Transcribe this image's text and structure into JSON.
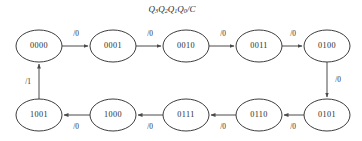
{
  "diagram": {
    "title": {
      "full": "Q3Q2Q1Q0/C",
      "parts": [
        {
          "base": "Q",
          "sub": "3"
        },
        {
          "base": "Q",
          "sub": "2"
        },
        {
          "base": "Q",
          "sub": "1"
        },
        {
          "base": "Q",
          "sub": "0"
        }
      ],
      "suffix": "/C"
    },
    "type": "state-transition-diagram",
    "colors": {
      "background": "#ffffff",
      "stroke": "#3d3d3d",
      "edge": "#4a4a4a",
      "text": "#2b2b2b"
    },
    "geometry": {
      "node_rx": 23,
      "node_ry": 16,
      "row_top_y": 46,
      "row_bottom_y": 115,
      "columns_x": [
        39,
        113,
        186,
        259,
        327
      ]
    },
    "nodes": [
      {
        "id": "s0",
        "label": "0000",
        "cx": 39,
        "cy": 46,
        "row": "top"
      },
      {
        "id": "s1",
        "label": "0001",
        "cx": 113,
        "cy": 46,
        "row": "top"
      },
      {
        "id": "s2",
        "label": "0010",
        "cx": 186,
        "cy": 46,
        "row": "top"
      },
      {
        "id": "s3",
        "label": "0011",
        "cx": 259,
        "cy": 46,
        "row": "top"
      },
      {
        "id": "s4",
        "label": "0100",
        "cx": 327,
        "cy": 46,
        "row": "top"
      },
      {
        "id": "s5",
        "label": "0101",
        "cx": 327,
        "cy": 115,
        "row": "bottom"
      },
      {
        "id": "s6",
        "label": "0110",
        "cx": 259,
        "cy": 115,
        "row": "bottom"
      },
      {
        "id": "s7",
        "label": "0111",
        "cx": 186,
        "cy": 115,
        "row": "bottom"
      },
      {
        "id": "s8",
        "label": "1000",
        "cx": 113,
        "cy": 115,
        "row": "bottom"
      },
      {
        "id": "s9",
        "label": "1001",
        "cx": 39,
        "cy": 115,
        "row": "bottom"
      }
    ],
    "edges": [
      {
        "id": "e0",
        "from": "0000",
        "to": "0001",
        "label": "/0",
        "lx": 76,
        "ly": 34,
        "direction": "right"
      },
      {
        "id": "e1",
        "from": "0001",
        "to": "0010",
        "label": "/0",
        "lx": 150,
        "ly": 34,
        "direction": "right"
      },
      {
        "id": "e2",
        "from": "0010",
        "to": "0011",
        "label": "/0",
        "lx": 223,
        "ly": 34,
        "direction": "right"
      },
      {
        "id": "e3",
        "from": "0011",
        "to": "0100",
        "label": "/0",
        "lx": 293,
        "ly": 34,
        "direction": "right"
      },
      {
        "id": "e4",
        "from": "0100",
        "to": "0101",
        "label": "/0",
        "lx": 338,
        "ly": 80,
        "direction": "down"
      },
      {
        "id": "e5",
        "from": "0101",
        "to": "0110",
        "label": "/0",
        "lx": 293,
        "ly": 127,
        "direction": "left"
      },
      {
        "id": "e6",
        "from": "0110",
        "to": "0111",
        "label": "/0",
        "lx": 223,
        "ly": 127,
        "direction": "left"
      },
      {
        "id": "e7",
        "from": "0111",
        "to": "1000",
        "label": "/0",
        "lx": 150,
        "ly": 127,
        "direction": "left"
      },
      {
        "id": "e8",
        "from": "1000",
        "to": "1001",
        "label": "/0",
        "lx": 76,
        "ly": 127,
        "direction": "left"
      },
      {
        "id": "e9",
        "from": "1001",
        "to": "0000",
        "label": "/1",
        "lx": 28,
        "ly": 82,
        "direction": "up"
      }
    ]
  }
}
